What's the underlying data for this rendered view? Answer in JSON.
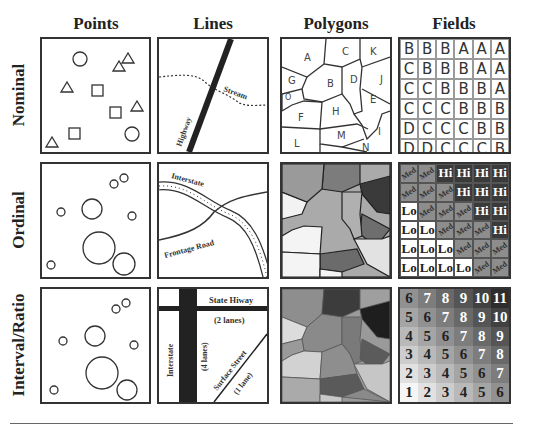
{
  "columns": [
    "Points",
    "Lines",
    "Polygons",
    "Fields"
  ],
  "rows": [
    "Nominal",
    "Ordinal",
    "Interval/Ratio"
  ],
  "lines_labels": {
    "nominal": {
      "road": "Highway",
      "stream": "Stream"
    },
    "ordinal": {
      "major": "Interstate",
      "minor": "Frontage Road"
    },
    "interval": {
      "hiway": "State Hiway",
      "hiway_lanes": "(2 lanes)",
      "interstate": "Interstate",
      "interstate_lanes": "(4 lanes)",
      "surface": "Surface Street",
      "surface_lanes": "(1 lane)"
    }
  },
  "polygon_labels": [
    "A",
    "B",
    "C",
    "D",
    "E",
    "F",
    "G",
    "H",
    "I",
    "J",
    "K",
    "L",
    "M",
    "N",
    "O"
  ],
  "fields": {
    "nominal": [
      [
        "B",
        "B",
        "B",
        "A",
        "A",
        "A"
      ],
      [
        "C",
        "B",
        "B",
        "B",
        "A",
        "A"
      ],
      [
        "C",
        "C",
        "B",
        "B",
        "B",
        "A"
      ],
      [
        "C",
        "C",
        "C",
        "B",
        "B",
        "B"
      ],
      [
        "D",
        "C",
        "C",
        "C",
        "B",
        "B"
      ],
      [
        "D",
        "D",
        "C",
        "C",
        "C",
        "B"
      ]
    ],
    "ordinal": [
      [
        "Med",
        "Med",
        "Hi",
        "Hi",
        "Hi",
        "Hi"
      ],
      [
        "Med",
        "Med",
        "Med",
        "Hi",
        "Hi",
        "Hi"
      ],
      [
        "Lo",
        "Med",
        "Med",
        "Med",
        "Hi",
        "Hi"
      ],
      [
        "Lo",
        "Lo",
        "Med",
        "Med",
        "Med",
        "Hi"
      ],
      [
        "Lo",
        "Lo",
        "Lo",
        "Med",
        "Med",
        "Med"
      ],
      [
        "Lo",
        "Lo",
        "Lo",
        "Lo",
        "Med",
        "Med"
      ]
    ],
    "interval": [
      [
        "6",
        "7",
        "8",
        "9",
        "10",
        "11"
      ],
      [
        "5",
        "6",
        "7",
        "8",
        "9",
        "10"
      ],
      [
        "4",
        "5",
        "6",
        "7",
        "8",
        "9"
      ],
      [
        "3",
        "4",
        "5",
        "6",
        "7",
        "8"
      ],
      [
        "2",
        "3",
        "4",
        "5",
        "6",
        "7"
      ],
      [
        "1",
        "2",
        "3",
        "4",
        "5",
        "6"
      ]
    ]
  },
  "point_symbols": {
    "nominal": [
      "circle-icon",
      "triangle-icon",
      "square-icon"
    ],
    "ordinal": "circle-icon",
    "interval": "circle-icon"
  }
}
